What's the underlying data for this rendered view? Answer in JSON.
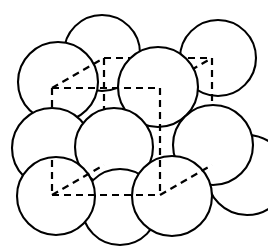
{
  "figure": {
    "name": "face-centered-cubic-unit-cell",
    "background_color": "#ffffff",
    "line_color": "#000000",
    "sphere_fill": "#ffffff",
    "canvas": {
      "width": 268,
      "height": 247
    }
  },
  "cube": {
    "style": "dashed",
    "dash_pattern": "7 5",
    "stroke_width": 2.2,
    "front_face": {
      "top_left": [
        52,
        88
      ],
      "top_right": [
        160,
        88
      ],
      "bottom_right": [
        160,
        195
      ],
      "bottom_left": [
        52,
        195
      ]
    },
    "back_face": {
      "top_left": [
        104,
        58
      ],
      "top_right": [
        212,
        58
      ],
      "bottom_right": [
        212,
        165
      ],
      "bottom_left": [
        104,
        165
      ]
    },
    "depth_offset": [
      52,
      -30
    ],
    "edges": [
      "front-top",
      "front-right",
      "front-bottom",
      "front-left",
      "back-top",
      "back-right",
      "back-bottom",
      "back-left",
      "connector-top-left",
      "connector-top-right",
      "connector-bottom-right",
      "connector-bottom-left"
    ]
  },
  "spheres": [
    {
      "id": "back-top-left",
      "cx": 58,
      "cy": 82,
      "r": 40,
      "layer": "back"
    },
    {
      "id": "back-top-center",
      "cx": 102,
      "cy": 53,
      "r": 38,
      "layer": "back"
    },
    {
      "id": "back-top-right",
      "cx": 218,
      "cy": 58,
      "r": 38,
      "layer": "back"
    },
    {
      "id": "back-face-center",
      "cx": 158,
      "cy": 87,
      "r": 40,
      "layer": "back"
    },
    {
      "id": "mid-left",
      "cx": 52,
      "cy": 148,
      "r": 40,
      "layer": "middle"
    },
    {
      "id": "front-face-center",
      "cx": 114,
      "cy": 147,
      "r": 39,
      "layer": "middle"
    },
    {
      "id": "mid-right",
      "cx": 213,
      "cy": 145,
      "r": 40,
      "layer": "middle"
    },
    {
      "id": "far-right",
      "cx": 247,
      "cy": 175,
      "r": 40,
      "layer": "middle"
    },
    {
      "id": "front-bottom-left",
      "cx": 56,
      "cy": 196,
      "r": 39,
      "layer": "front"
    },
    {
      "id": "front-bottom-mid",
      "cx": 120,
      "cy": 207,
      "r": 38,
      "layer": "front"
    },
    {
      "id": "front-bottom-right",
      "cx": 172,
      "cy": 196,
      "r": 40,
      "layer": "front"
    }
  ],
  "counts": {
    "sphere_count": 11,
    "cube_vertex_count": 8,
    "cube_edge_count": 12
  }
}
